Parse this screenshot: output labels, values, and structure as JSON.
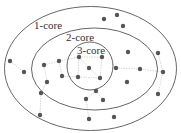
{
  "diagram": {
    "colors": {
      "ring": "#555555",
      "node": "#555555",
      "edge": "#bbbbbb",
      "label": "#333333",
      "background": "#ffffff"
    },
    "rings": [
      {
        "id": "core1",
        "label": "1-core",
        "shape": "ellipse",
        "cx": 90.5,
        "cy": 68.5,
        "rx": 86,
        "ry": 62,
        "label_x": 34,
        "label_y": 29
      },
      {
        "id": "core2",
        "label": "2-core",
        "shape": "ellipse",
        "cx": 94.5,
        "cy": 69,
        "rx": 63,
        "ry": 41,
        "label_x": 66,
        "label_y": 41
      },
      {
        "id": "core3",
        "label": "3-core",
        "shape": "ellipse",
        "cx": 90,
        "cy": 66,
        "rx": 23,
        "ry": 24,
        "label_x": 77,
        "label_y": 54
      }
    ],
    "nodes": [
      {
        "id": "n1",
        "x": 104,
        "y": 19,
        "core": 1
      },
      {
        "id": "n2",
        "x": 117,
        "y": 15,
        "core": 1
      },
      {
        "id": "n3",
        "x": 123,
        "y": 26,
        "core": 1
      },
      {
        "id": "n4",
        "x": 79,
        "y": 57,
        "core": 3
      },
      {
        "id": "n5",
        "x": 102,
        "y": 57,
        "core": 3
      },
      {
        "id": "n6",
        "x": 89,
        "y": 68,
        "core": 3
      },
      {
        "id": "n7",
        "x": 78,
        "y": 77,
        "core": 3
      },
      {
        "id": "n8",
        "x": 100,
        "y": 78,
        "core": 3
      },
      {
        "id": "n9",
        "x": 10,
        "y": 61,
        "core": 1
      },
      {
        "id": "n10",
        "x": 24,
        "y": 72,
        "core": 1
      },
      {
        "id": "n11",
        "x": 44,
        "y": 65,
        "core": 2
      },
      {
        "id": "n12",
        "x": 59,
        "y": 61,
        "core": 2
      },
      {
        "id": "n13",
        "x": 62,
        "y": 76,
        "core": 2
      },
      {
        "id": "n14",
        "x": 47,
        "y": 82,
        "core": 2
      },
      {
        "id": "n15",
        "x": 116,
        "y": 68,
        "core": 2
      },
      {
        "id": "n16",
        "x": 128,
        "y": 52,
        "core": 2
      },
      {
        "id": "n17",
        "x": 140,
        "y": 69,
        "core": 2
      },
      {
        "id": "n18",
        "x": 127,
        "y": 82,
        "core": 2
      },
      {
        "id": "n19",
        "x": 158,
        "y": 53,
        "core": 1
      },
      {
        "id": "n20",
        "x": 163,
        "y": 72,
        "core": 1
      },
      {
        "id": "n21",
        "x": 158,
        "y": 94,
        "core": 1
      },
      {
        "id": "n22",
        "x": 96,
        "y": 91,
        "core": 2
      },
      {
        "id": "n23",
        "x": 86,
        "y": 99,
        "core": 2
      },
      {
        "id": "n24",
        "x": 103,
        "y": 100,
        "core": 2
      },
      {
        "id": "n25",
        "x": 41,
        "y": 93,
        "core": 1
      },
      {
        "id": "n26",
        "x": 40,
        "y": 115,
        "core": 1
      },
      {
        "id": "n27",
        "x": 89,
        "y": 119,
        "core": 1
      },
      {
        "id": "n28",
        "x": 114,
        "y": 117,
        "core": 1
      }
    ],
    "edges": [
      [
        "n4",
        "n5"
      ],
      [
        "n4",
        "n7"
      ],
      [
        "n5",
        "n8"
      ],
      [
        "n7",
        "n8"
      ],
      [
        "n4",
        "n6"
      ],
      [
        "n6",
        "n8"
      ],
      [
        "n9",
        "n10"
      ],
      [
        "n11",
        "n12"
      ],
      [
        "n11",
        "n14"
      ],
      [
        "n12",
        "n13"
      ],
      [
        "n13",
        "n7"
      ],
      [
        "n15",
        "n17"
      ],
      [
        "n17",
        "n20"
      ],
      [
        "n19",
        "n20"
      ],
      [
        "n20",
        "n21"
      ],
      [
        "n22",
        "n23"
      ],
      [
        "n22",
        "n24"
      ],
      [
        "n14",
        "n25"
      ],
      [
        "n25",
        "n26"
      ],
      [
        "n23",
        "n27"
      ],
      [
        "n12",
        "n4"
      ]
    ]
  }
}
